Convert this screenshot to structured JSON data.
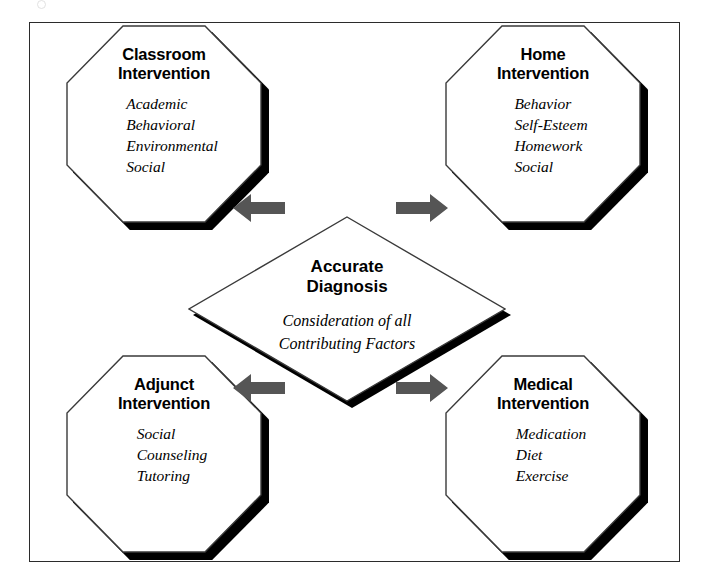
{
  "figure": {
    "type": "concept-diagram",
    "layout": "four octagon nodes around a central diamond, connected by gray block arrows",
    "frame_color": "#2b2b2b",
    "arrow_color": "#555555",
    "shadow_color": "#000000",
    "background": "#ffffff"
  },
  "center": {
    "shape": "diamond",
    "title": "Accurate\nDiagnosis",
    "subtitle": "Consideration of all\nContributing Factors"
  },
  "nodes": [
    {
      "id": "classroom",
      "position": "top-left",
      "shape": "octagon",
      "title": "Classroom\nIntervention",
      "items": [
        "Academic",
        "Behavioral",
        "Environmental",
        "Social"
      ]
    },
    {
      "id": "home",
      "position": "top-right",
      "shape": "octagon",
      "title": "Home\nIntervention",
      "items": [
        "Behavior",
        "Self-Esteem",
        "Homework",
        "Social"
      ]
    },
    {
      "id": "adjunct",
      "position": "bottom-left",
      "shape": "octagon",
      "title": "Adjunct\nIntervention",
      "items": [
        "Social",
        "Counseling",
        "Tutoring"
      ]
    },
    {
      "id": "medical",
      "position": "bottom-right",
      "shape": "octagon",
      "title": "Medical\nIntervention",
      "items": [
        "Medication",
        "Diet",
        "Exercise"
      ]
    }
  ],
  "arrows": [
    {
      "id": "to-classroom",
      "direction": "left",
      "from": "center",
      "to": "classroom"
    },
    {
      "id": "to-home",
      "direction": "right",
      "from": "center",
      "to": "home"
    },
    {
      "id": "to-adjunct",
      "direction": "left",
      "from": "center",
      "to": "adjunct"
    },
    {
      "id": "to-medical",
      "direction": "right",
      "from": "center",
      "to": "medical"
    }
  ]
}
